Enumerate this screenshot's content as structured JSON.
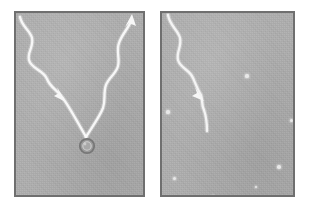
{
  "figure": {
    "title": "",
    "background_color": "#ffffff",
    "width": 311,
    "height": 213
  },
  "panels": [
    {
      "id": "panel-left",
      "label": "",
      "x": 14,
      "y": 11,
      "width": 131,
      "height": 186,
      "background_color": "#aeaeae",
      "border_color": "#6f6f6f",
      "filament": {
        "name": "v-shaped-filament",
        "stroke_color": "#f4f4f4",
        "stroke_width": 2.2,
        "description": "Bright wavy V-shaped track descending from upper-left and upper-right, meeting at a particle near bottom center",
        "left_branch_path": "M 20,17 C 22,27 30,30 32,38 C 34,47 27,52 29,60 C 31,69 44,70 47,79 C 50,87 57,90 62,97 C 66,102 76,119 86,137",
        "right_branch_path": "M 86,137 C 94,124 100,116 103,108 C 106,99 103,93 106,85 C 109,77 116,74 118,66 C 120,58 116,51 119,43 C 122,34 128,29 131,21",
        "arrowheads": [
          {
            "name": "arrowhead-upper-right",
            "x": 131,
            "y": 21,
            "angle": -68
          },
          {
            "name": "arrowhead-mid-left",
            "x": 62,
            "y": 97,
            "angle": 52
          }
        ]
      },
      "particle": {
        "name": "circular-particle",
        "cx": 87,
        "cy": 146,
        "r": 6.5,
        "fill_color": "#a0a0a0",
        "ring_color": "#7d7d7d",
        "highlight_color": "#cfcfcf"
      },
      "specks": []
    },
    {
      "id": "panel-right",
      "label": "",
      "x": 160,
      "y": 11,
      "width": 135,
      "height": 186,
      "background_color": "#aeaeae",
      "border_color": "#6f6f6f",
      "filament": {
        "name": "single-curved-filament",
        "stroke_color": "#f4f4f4",
        "stroke_width": 2.2,
        "description": "Bright wavy track descending diagonally from upper-left to mid-center, terminating freely",
        "left_branch_path": "M 168,17 C 170,27 178,30 180,38 C 182,47 176,52 178,60 C 180,68 190,70 193,78 C 196,85 198,90 201,95 C 203,100 201,104 204,110 C 206,116 207,122 207,131",
        "right_branch_path": "",
        "arrowheads": [
          {
            "name": "arrowhead-mid",
            "x": 201,
            "y": 96,
            "angle": 58
          }
        ]
      },
      "particle": null,
      "specks": [
        {
          "name": "speck",
          "x": 247,
          "y": 76,
          "r": 1.6
        },
        {
          "name": "speck",
          "x": 168,
          "y": 112,
          "r": 1.6
        },
        {
          "name": "speck",
          "x": 291,
          "y": 120,
          "r": 1.5
        },
        {
          "name": "speck",
          "x": 279,
          "y": 167,
          "r": 1.7
        },
        {
          "name": "speck",
          "x": 174,
          "y": 178,
          "r": 1.5
        },
        {
          "name": "speck",
          "x": 256,
          "y": 187,
          "r": 1.4
        },
        {
          "name": "speck",
          "x": 213,
          "y": 196,
          "r": 1.2
        }
      ]
    }
  ],
  "colors": {
    "panel_fill": "#aeaeae",
    "panel_border": "#6f6f6f",
    "filament": "#f4f4f4",
    "particle": "#a0a0a0",
    "page_background": "#ffffff"
  }
}
